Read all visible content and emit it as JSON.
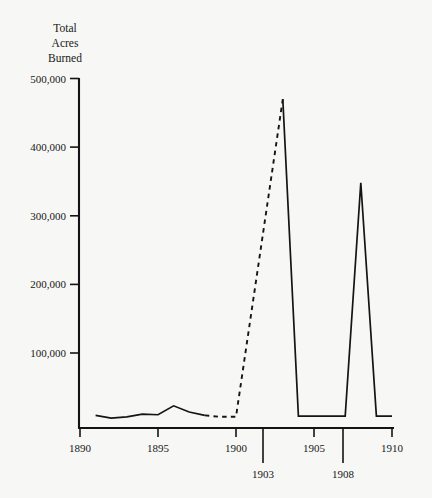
{
  "chart_data": {
    "type": "line",
    "title": "Total Acres Burned",
    "title_lines": [
      "Total",
      "Acres",
      "Burned"
    ],
    "xlabel": "",
    "ylabel": "Total Acres Burned",
    "xlim": [
      1890,
      1910
    ],
    "ylim": [
      0,
      500000
    ],
    "grid": false,
    "legend": null,
    "ytick_labels": [
      "500,000",
      "400,000",
      "300,000",
      "200,000",
      "100,000"
    ],
    "ytick_values": [
      500000,
      400000,
      300000,
      200000,
      100000
    ],
    "xtick_labels": [
      "1890",
      "1895",
      "1900",
      "1905",
      "1910"
    ],
    "xtick_values": [
      1890,
      1895,
      1900,
      1905,
      1910
    ],
    "xtick_labels_lower": [
      "1903",
      "1908"
    ],
    "xtick_values_lower": [
      1903,
      1908
    ],
    "series": [
      {
        "name": "Recorded acres burned",
        "style": "solid",
        "x": [
          1891,
          1892,
          1893,
          1894,
          1895,
          1896,
          1897,
          1898
        ],
        "values": [
          9000,
          5000,
          7000,
          11000,
          10000,
          23000,
          14000,
          9000
        ]
      },
      {
        "name": "Estimated acres burned",
        "style": "dashed",
        "x": [
          1898,
          1899,
          1900,
          1903
        ],
        "values": [
          9000,
          7000,
          7000,
          470000
        ]
      },
      {
        "name": "Recorded acres burned (peaks)",
        "style": "solid",
        "x": [
          1903,
          1904,
          1905,
          1906,
          1907,
          1908,
          1909,
          1910
        ],
        "values": [
          470000,
          8000,
          8000,
          8000,
          8000,
          348000,
          8000,
          8000
        ]
      }
    ],
    "annotations": [
      {
        "label": "peak-1903",
        "x": 1903,
        "y": 470000
      },
      {
        "label": "peak-1908",
        "x": 1908,
        "y": 348000
      }
    ]
  }
}
